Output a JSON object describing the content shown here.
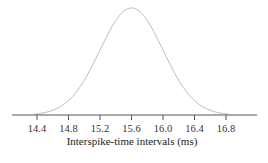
{
  "chart_data": {
    "type": "line",
    "title": "",
    "xlabel": "Interspike-time intervals (ms)",
    "ylabel": "",
    "curve": "gaussian",
    "mean": 15.6,
    "std": 0.4,
    "xlim": [
      14.1,
      17.2
    ],
    "ticks": [
      14.4,
      14.8,
      15.2,
      15.6,
      16.0,
      16.4,
      16.8
    ],
    "tick_labels": [
      "14.4",
      "14.8",
      "15.2",
      "15.6",
      "16.0",
      "16.4",
      "16.8"
    ],
    "grid": false,
    "legend": null,
    "colors": {
      "curve": "#b8b8b8",
      "axis": "#555555"
    }
  }
}
